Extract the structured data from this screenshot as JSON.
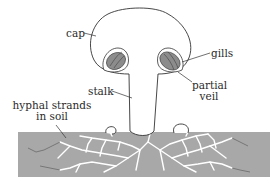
{
  "diagram": {
    "labels": {
      "cap": "cap",
      "gills": "gills",
      "stalk": "stalk",
      "partial_veil_line1": "partial",
      "partial_veil_line2": "veil",
      "hyphal_line1": "hyphal strands",
      "hyphal_line2": "in soil"
    },
    "colors": {
      "outline": "#333333",
      "soil": "#a8a8a8",
      "gills": "#8c8c8c",
      "background": "#ffffff",
      "hyphae": "#ffffff"
    }
  }
}
